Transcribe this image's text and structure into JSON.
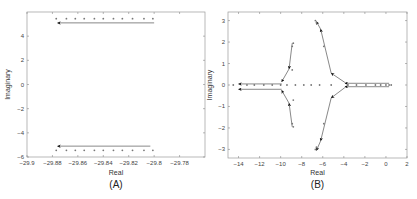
{
  "figure": {
    "panels": [
      "(A)",
      "(B)"
    ]
  },
  "chart_data": [
    {
      "type": "scatter",
      "panel_label": "(A)",
      "title": "",
      "xlabel": "Real",
      "ylabel": "Imaginary",
      "xlim": [
        -29.9,
        -29.76
      ],
      "ylim": [
        -6,
        6
      ],
      "xticks": [
        -29.9,
        -29.88,
        -29.86,
        -29.84,
        -29.82,
        -29.8,
        -29.78
      ],
      "xtick_labels": [
        "−29.9",
        "−29.88",
        "−29.86",
        "−29.84",
        "−29.82",
        "−29.8",
        "−29.78"
      ],
      "yticks": [
        -6,
        -4,
        -2,
        0,
        2,
        4
      ],
      "ytick_labels": [
        "−6",
        "−4",
        "−2",
        "0",
        "2",
        "4"
      ],
      "grid": false,
      "series": [
        {
          "name": "upper pole trajectory",
          "marker": "dot",
          "points": [
            [
              -29.877,
              5.45
            ],
            [
              -29.869,
              5.45
            ],
            [
              -29.862,
              5.45
            ],
            [
              -29.855,
              5.45
            ],
            [
              -29.847,
              5.45
            ],
            [
              -29.84,
              5.45
            ],
            [
              -29.832,
              5.45
            ],
            [
              -29.825,
              5.45
            ],
            [
              -29.817,
              5.45
            ],
            [
              -29.808,
              5.45
            ],
            [
              -29.801,
              5.45
            ]
          ]
        },
        {
          "name": "lower pole trajectory",
          "marker": "dot",
          "points": [
            [
              -29.877,
              -5.45
            ],
            [
              -29.869,
              -5.45
            ],
            [
              -29.862,
              -5.45
            ],
            [
              -29.855,
              -5.45
            ],
            [
              -29.847,
              -5.45
            ],
            [
              -29.84,
              -5.45
            ],
            [
              -29.832,
              -5.45
            ],
            [
              -29.825,
              -5.45
            ],
            [
              -29.817,
              -5.45
            ],
            [
              -29.808,
              -5.45
            ],
            [
              -29.801,
              -5.45
            ]
          ]
        }
      ],
      "arrows": [
        {
          "from": [
            -29.8,
            5.1
          ],
          "to": [
            -29.876,
            5.1
          ]
        },
        {
          "from": [
            -29.803,
            -5.1
          ],
          "to": [
            -29.876,
            -5.1
          ]
        }
      ]
    },
    {
      "type": "scatter",
      "panel_label": "(B)",
      "title": "",
      "xlabel": "Real",
      "ylabel": "Imaginary",
      "xlim": [
        -15,
        2
      ],
      "ylim": [
        -3.4,
        3.4
      ],
      "xticks": [
        -14,
        -12,
        -10,
        -8,
        -6,
        -4,
        -2,
        0,
        2
      ],
      "xtick_labels": [
        "−14",
        "−12",
        "−10",
        "−8",
        "−6",
        "−4",
        "−2",
        "0",
        "2"
      ],
      "yticks": [
        -3,
        -2,
        -1,
        0,
        1,
        2,
        3
      ],
      "ytick_labels": [
        "−3",
        "−2",
        "−1",
        "0",
        "1",
        "2",
        "3"
      ],
      "grid": false,
      "series": [
        {
          "name": "real-axis poles",
          "marker": "dot",
          "points": [
            [
              -14.5,
              0
            ],
            [
              -13.2,
              0
            ],
            [
              -12.5,
              0
            ],
            [
              -11.6,
              0
            ],
            [
              -10.8,
              0
            ],
            [
              -10.0,
              0
            ],
            [
              -9.4,
              0
            ],
            [
              -8.6,
              0
            ],
            [
              -7.8,
              0
            ],
            [
              -7.1,
              0
            ],
            [
              -6.3,
              0
            ],
            [
              -5.2,
              0
            ],
            [
              -3.6,
              0
            ],
            [
              -2.8,
              0
            ],
            [
              -1.9,
              0
            ],
            [
              -1.0,
              0
            ],
            [
              -0.5,
              0
            ],
            [
              0.0,
              0
            ],
            [
              0.3,
              0
            ],
            [
              0.5,
              0
            ]
          ]
        },
        {
          "name": "complex poles (left branch)",
          "marker": "dot",
          "points": [
            [
              -8.8,
              1.95
            ],
            [
              -8.9,
              1.8
            ],
            [
              -8.9,
              0.7
            ],
            [
              -8.8,
              -0.7
            ],
            [
              -8.9,
              -1.8
            ],
            [
              -8.8,
              -1.95
            ]
          ]
        },
        {
          "name": "complex poles (right branch)",
          "marker": "dot",
          "points": [
            [
              -6.7,
              3.0
            ],
            [
              -6.6,
              2.9
            ],
            [
              -5.9,
              1.8
            ],
            [
              -5.9,
              -1.8
            ],
            [
              -6.6,
              -2.9
            ],
            [
              -6.7,
              -3.0
            ]
          ]
        }
      ],
      "arrows": [
        {
          "from": [
            -9.9,
            0.05
          ],
          "to": [
            -14.0,
            0.05
          ]
        },
        {
          "from": [
            -9.9,
            -0.2
          ],
          "to": [
            -14.0,
            -0.2
          ]
        },
        {
          "from": [
            -8.9,
            1.95
          ],
          "to": [
            -9.2,
            0.75
          ]
        },
        {
          "from": [
            -9.2,
            0.75
          ],
          "to": [
            -9.9,
            0.15
          ]
        },
        {
          "from": [
            -8.9,
            -1.95
          ],
          "to": [
            -9.2,
            -0.85
          ]
        },
        {
          "from": [
            -9.2,
            -0.85
          ],
          "to": [
            -9.9,
            -0.25
          ]
        },
        {
          "from": [
            0.3,
            0.08
          ],
          "to": [
            -3.9,
            0.08
          ]
        },
        {
          "from": [
            0.3,
            -0.08
          ],
          "to": [
            -3.9,
            -0.08
          ]
        },
        {
          "from": [
            -3.9,
            0.12
          ],
          "to": [
            -5.2,
            0.55
          ]
        },
        {
          "from": [
            -5.2,
            0.55
          ],
          "to": [
            -6.2,
            2.6
          ]
        },
        {
          "from": [
            -6.2,
            2.6
          ],
          "to": [
            -6.6,
            2.95
          ]
        },
        {
          "from": [
            -3.9,
            -0.12
          ],
          "to": [
            -5.2,
            -0.6
          ]
        },
        {
          "from": [
            -5.2,
            -0.6
          ],
          "to": [
            -6.2,
            -2.6
          ]
        },
        {
          "from": [
            -6.2,
            -2.6
          ],
          "to": [
            -6.6,
            -3.05
          ]
        }
      ]
    }
  ]
}
